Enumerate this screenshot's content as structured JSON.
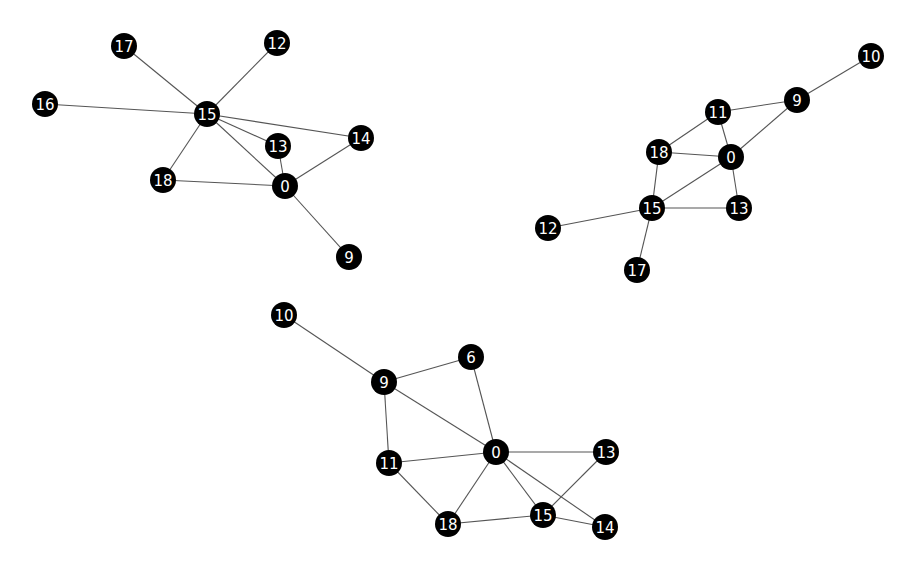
{
  "style": {
    "node_color": "#000000",
    "label_color": "#ffffff",
    "edge_color": "#555555",
    "node_radius": 13
  },
  "graphs": [
    {
      "name": "graph-1",
      "nodes": [
        {
          "id": "17",
          "x": 124,
          "y": 46
        },
        {
          "id": "12",
          "x": 277,
          "y": 43
        },
        {
          "id": "16",
          "x": 45,
          "y": 104
        },
        {
          "id": "15",
          "x": 207,
          "y": 114
        },
        {
          "id": "14",
          "x": 361,
          "y": 138
        },
        {
          "id": "13",
          "x": 278,
          "y": 146
        },
        {
          "id": "18",
          "x": 163,
          "y": 180
        },
        {
          "id": "0",
          "x": 285,
          "y": 186
        },
        {
          "id": "9",
          "x": 349,
          "y": 257
        }
      ],
      "edges": [
        [
          "17",
          "15"
        ],
        [
          "12",
          "15"
        ],
        [
          "16",
          "15"
        ],
        [
          "15",
          "14"
        ],
        [
          "15",
          "13"
        ],
        [
          "15",
          "0"
        ],
        [
          "15",
          "18"
        ],
        [
          "13",
          "0"
        ],
        [
          "18",
          "0"
        ],
        [
          "0",
          "14"
        ],
        [
          "0",
          "9"
        ]
      ]
    },
    {
      "name": "graph-2",
      "nodes": [
        {
          "id": "10",
          "x": 871,
          "y": 56
        },
        {
          "id": "9",
          "x": 797,
          "y": 100
        },
        {
          "id": "11",
          "x": 718,
          "y": 112
        },
        {
          "id": "18",
          "x": 659,
          "y": 152
        },
        {
          "id": "0",
          "x": 731,
          "y": 157
        },
        {
          "id": "15",
          "x": 652,
          "y": 208
        },
        {
          "id": "13",
          "x": 739,
          "y": 208
        },
        {
          "id": "12",
          "x": 548,
          "y": 228
        },
        {
          "id": "17",
          "x": 637,
          "y": 270
        }
      ],
      "edges": [
        [
          "10",
          "9"
        ],
        [
          "9",
          "11"
        ],
        [
          "9",
          "0"
        ],
        [
          "11",
          "18"
        ],
        [
          "11",
          "0"
        ],
        [
          "18",
          "0"
        ],
        [
          "18",
          "15"
        ],
        [
          "0",
          "15"
        ],
        [
          "0",
          "13"
        ],
        [
          "15",
          "13"
        ],
        [
          "15",
          "12"
        ],
        [
          "15",
          "17"
        ]
      ]
    },
    {
      "name": "graph-3",
      "nodes": [
        {
          "id": "10",
          "x": 284,
          "y": 315
        },
        {
          "id": "9",
          "x": 384,
          "y": 382
        },
        {
          "id": "6",
          "x": 471,
          "y": 357
        },
        {
          "id": "0",
          "x": 496,
          "y": 452
        },
        {
          "id": "13",
          "x": 606,
          "y": 452
        },
        {
          "id": "11",
          "x": 389,
          "y": 463
        },
        {
          "id": "18",
          "x": 448,
          "y": 524
        },
        {
          "id": "15",
          "x": 543,
          "y": 515
        },
        {
          "id": "14",
          "x": 605,
          "y": 527
        }
      ],
      "edges": [
        [
          "10",
          "9"
        ],
        [
          "9",
          "6"
        ],
        [
          "9",
          "0"
        ],
        [
          "9",
          "11"
        ],
        [
          "6",
          "0"
        ],
        [
          "0",
          "11"
        ],
        [
          "0",
          "13"
        ],
        [
          "0",
          "18"
        ],
        [
          "0",
          "15"
        ],
        [
          "0",
          "14"
        ],
        [
          "11",
          "18"
        ],
        [
          "18",
          "15"
        ],
        [
          "15",
          "13"
        ],
        [
          "15",
          "14"
        ]
      ]
    }
  ]
}
